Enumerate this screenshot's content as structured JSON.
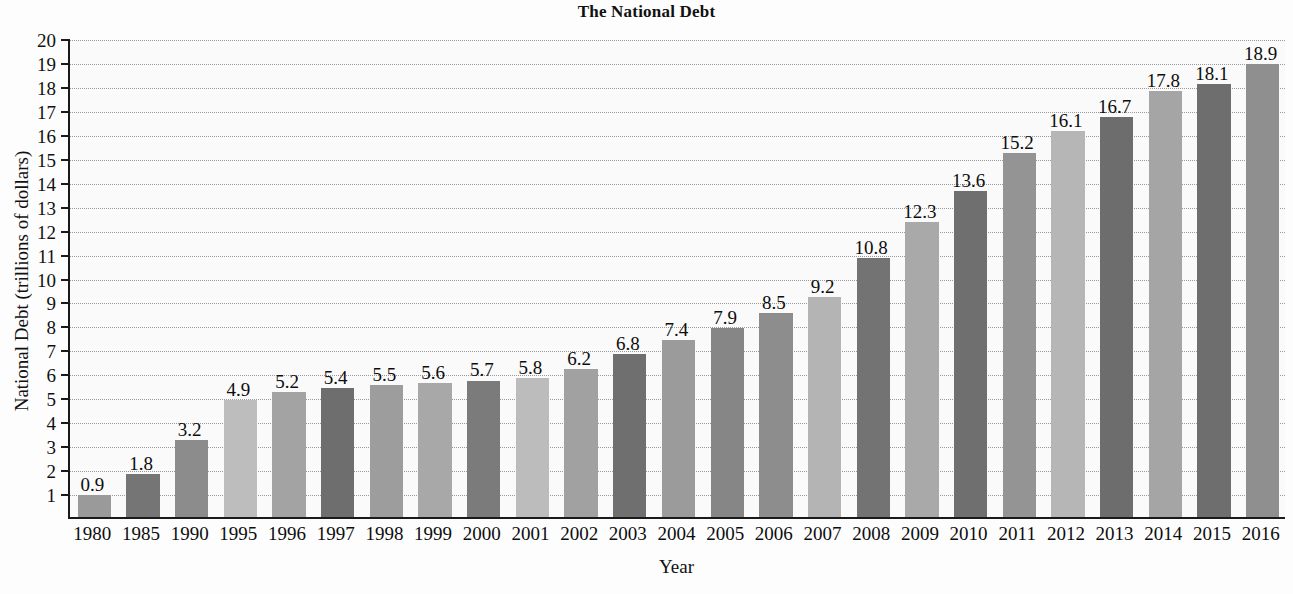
{
  "chart_data": {
    "type": "bar",
    "title": "The National Debt",
    "xlabel": "Year",
    "ylabel": "National Debt (trillions of dollars)",
    "categories": [
      "1980",
      "1985",
      "1990",
      "1995",
      "1996",
      "1997",
      "1998",
      "1999",
      "2000",
      "2001",
      "2002",
      "2003",
      "2004",
      "2005",
      "2006",
      "2007",
      "2008",
      "2009",
      "2010",
      "2011",
      "2012",
      "2013",
      "2014",
      "2015",
      "2016"
    ],
    "values": [
      0.9,
      1.8,
      3.2,
      4.9,
      5.2,
      5.4,
      5.5,
      5.6,
      5.7,
      5.8,
      6.2,
      6.8,
      7.4,
      7.9,
      8.5,
      9.2,
      10.8,
      12.3,
      13.6,
      15.2,
      16.1,
      16.7,
      17.8,
      18.1,
      18.9
    ],
    "value_labels": [
      "0.9",
      "1.8",
      "3.2",
      "4.9",
      "5.2",
      "5.4",
      "5.5",
      "5.6",
      "5.7",
      "5.8",
      "6.2",
      "6.8",
      "7.4",
      "7.9",
      "8.5",
      "9.2",
      "10.8",
      "12.3",
      "13.6",
      "15.2",
      "16.1",
      "16.7",
      "17.8",
      "18.1",
      "18.9"
    ],
    "ylim": [
      0,
      20
    ],
    "ytick_labels": [
      "20",
      "19",
      "18",
      "17",
      "16",
      "15",
      "14",
      "13",
      "12",
      "11",
      "10",
      "9",
      "8",
      "7",
      "6",
      "5",
      "4",
      "3",
      "2",
      "1"
    ],
    "ytick_values": [
      20,
      19,
      18,
      17,
      16,
      15,
      14,
      13,
      12,
      11,
      10,
      9,
      8,
      7,
      6,
      5,
      4,
      3,
      2,
      1
    ],
    "grid": true,
    "legend": "none",
    "bar_colors": [
      "#9a9a9a",
      "#757575",
      "#8c8c8c",
      "#bdbdbd",
      "#a3a3a3",
      "#6e6e6e",
      "#9d9d9d",
      "#a8a8a8",
      "#7b7b7b",
      "#bcbcbc",
      "#a1a1a1",
      "#6f6f6f",
      "#9b9b9b",
      "#868686",
      "#8d8d8d",
      "#b4b4b4",
      "#737373",
      "#a9a9a9",
      "#6f6f6f",
      "#949494",
      "#b6b6b6",
      "#6d6d6d",
      "#a5a5a5",
      "#6e6e6e",
      "#8f8f8f"
    ],
    "axis_color": "#1a1a1a",
    "grid_color": "#9a9a9a",
    "plot_background": "#fafafa"
  }
}
